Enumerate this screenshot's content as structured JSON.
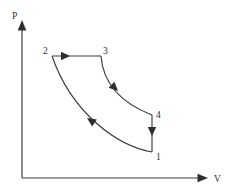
{
  "figure": {
    "kind": "pv-diagram",
    "background_color": "#ffffff",
    "stroke_color": "#3a3a3a",
    "arrow_color": "#2e2e2e"
  },
  "axes": {
    "y_label": "P",
    "x_label": "V",
    "origin": {
      "x": 22,
      "y": 178
    },
    "y_axis_tip": {
      "x": 22,
      "y": 20
    },
    "x_axis_tip": {
      "x": 208,
      "y": 178
    },
    "y_label_pos": {
      "x": 12,
      "y": 18
    },
    "x_label_pos": {
      "x": 214,
      "y": 181
    }
  },
  "states": [
    {
      "name": "1",
      "label": "1",
      "x": 152,
      "y": 152,
      "label_x": 156,
      "label_y": 160
    },
    {
      "name": "2",
      "label": "2",
      "x": 52,
      "y": 56,
      "label_x": 43,
      "label_y": 54
    },
    {
      "name": "3",
      "label": "3",
      "x": 101,
      "y": 56,
      "label_x": 103,
      "label_y": 54
    },
    {
      "name": "4",
      "label": "4",
      "x": 152,
      "y": 115,
      "label_x": 156,
      "label_y": 118
    }
  ],
  "processes": [
    {
      "name": "process-2-to-3",
      "from": "2",
      "to": "3",
      "shape": "straight",
      "path": "M 52 56 L 101 56",
      "arrow": {
        "x": 70,
        "y": 56,
        "angle": 0
      }
    },
    {
      "name": "process-3-to-4",
      "from": "3",
      "to": "4",
      "shape": "curve",
      "path": "M 101 56 C 103 83, 121 103, 152 115",
      "arrow": {
        "x": 118,
        "y": 91,
        "angle": 44
      }
    },
    {
      "name": "process-4-to-1",
      "from": "4",
      "to": "1",
      "shape": "straight",
      "path": "M 152 115 L 152 152",
      "arrow": {
        "x": 152,
        "y": 136,
        "angle": 90
      }
    },
    {
      "name": "process-1-to-2",
      "from": "1",
      "to": "2",
      "shape": "curve",
      "path": "M 152 152 C 118 146, 72 114, 52 56",
      "arrow": {
        "x": 87,
        "y": 118,
        "angle": 214
      }
    }
  ]
}
